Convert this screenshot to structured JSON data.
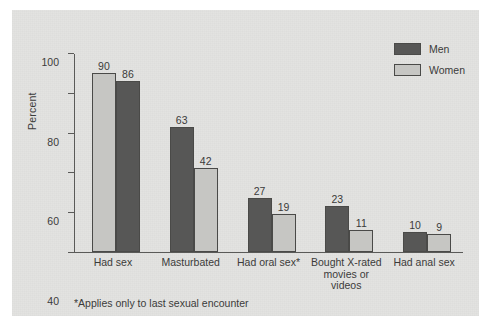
{
  "chart_data": {
    "type": "bar",
    "title": "",
    "xlabel": "",
    "ylabel": "Percent",
    "ylim": [
      0,
      100
    ],
    "yticks": [
      0,
      20,
      40,
      60,
      80,
      100
    ],
    "grid": false,
    "legend_position": "top-right",
    "categories": [
      "Had sex",
      "Masturbated",
      "Had oral sex*",
      "Bought X-rated movies or videos",
      "Had anal sex"
    ],
    "category_lines": [
      [
        "Had sex"
      ],
      [
        "Masturbated"
      ],
      [
        "Had oral sex*"
      ],
      [
        "Bought X-rated",
        "movies or",
        "videos"
      ],
      [
        "Had anal sex"
      ]
    ],
    "series": [
      {
        "name": "Men",
        "color": "#575756",
        "values": [
          90,
          63,
          27,
          23,
          10
        ]
      },
      {
        "name": "Women",
        "color": "#c6c6c3",
        "values": [
          86,
          42,
          19,
          11,
          9
        ]
      }
    ],
    "annotations": [
      "*Applies only to last sexual encounter"
    ]
  },
  "legend": {
    "items": [
      {
        "label": "Men",
        "swatch": "dark-gray"
      },
      {
        "label": "Women",
        "swatch": "light-gray"
      }
    ]
  },
  "footnote": "*Applies only to last sexual encounter"
}
